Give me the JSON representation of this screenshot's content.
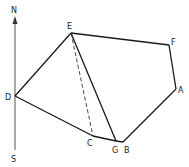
{
  "diagram": {
    "compass": {
      "north_label": "N",
      "south_label": "S",
      "north": [
        15,
        18
      ],
      "south": [
        15,
        150
      ]
    },
    "points": {
      "A": {
        "label": "A",
        "x": 176,
        "y": 89,
        "lx": 178,
        "ly": 92
      },
      "B": {
        "label": "B",
        "x": 123,
        "y": 142,
        "lx": 124,
        "ly": 153
      },
      "C": {
        "label": "C",
        "x": 93,
        "y": 136,
        "lx": 87,
        "ly": 146
      },
      "D": {
        "label": "D",
        "x": 15,
        "y": 96,
        "lx": 6,
        "ly": 100
      },
      "E": {
        "label": "E",
        "x": 71,
        "y": 33,
        "lx": 67,
        "ly": 29
      },
      "F": {
        "label": "F",
        "x": 169,
        "y": 45,
        "lx": 171,
        "ly": 44
      },
      "G": {
        "label": "G",
        "x": 116,
        "y": 141,
        "lx": 112,
        "ly": 153
      }
    },
    "solid_edges": [
      [
        "D",
        "E"
      ],
      [
        "E",
        "F"
      ],
      [
        "F",
        "A"
      ],
      [
        "A",
        "B"
      ],
      [
        "B",
        "G"
      ],
      [
        "G",
        "C"
      ],
      [
        "C",
        "D"
      ],
      [
        "E",
        "G"
      ]
    ],
    "dashed_edges": [
      [
        "E",
        "C"
      ]
    ],
    "stroke_color": "#1a1a1a"
  }
}
